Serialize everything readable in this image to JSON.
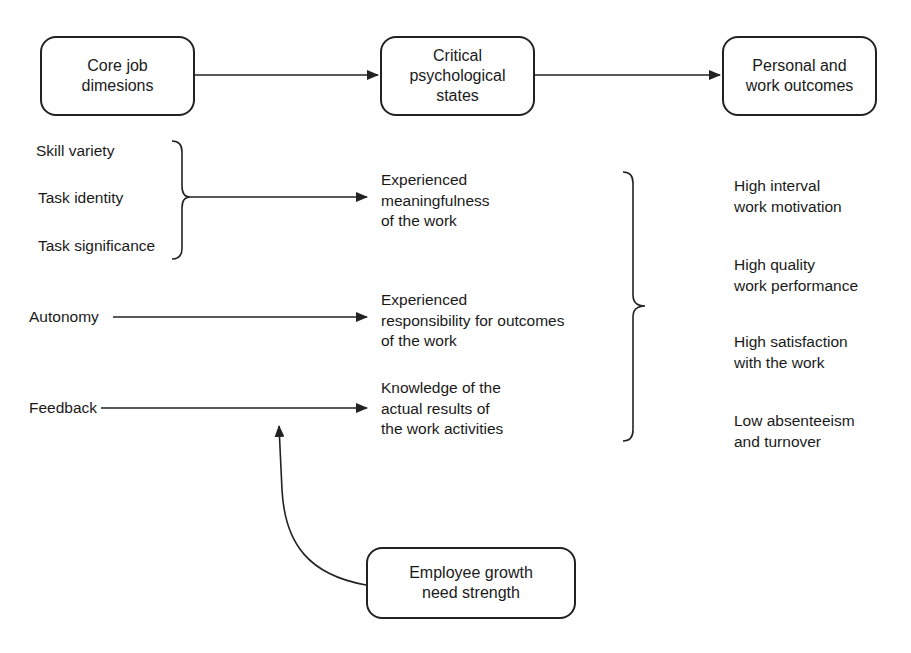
{
  "diagram": {
    "headers": [
      {
        "id": "core",
        "label": "Core job\ndimesions"
      },
      {
        "id": "critical",
        "label": "Critical\npsychological\nstates"
      },
      {
        "id": "outcomes",
        "label": "Personal and\nwork outcomes"
      }
    ],
    "dimensions": [
      {
        "label": "Skill variety"
      },
      {
        "label": "Task identity"
      },
      {
        "label": "Task significance"
      },
      {
        "label": "Autonomy"
      },
      {
        "label": "Feedback"
      }
    ],
    "states": [
      {
        "label": "Experienced\nmeaningfulness\nof the work"
      },
      {
        "label": "Experienced\nresponsibility for outcomes\nof the work"
      },
      {
        "label": "Knowledge of the\nactual results of\nthe work activities"
      }
    ],
    "outcomes": [
      {
        "label": "High interval\nwork motivation"
      },
      {
        "label": "High quality\nwork performance"
      },
      {
        "label": "High satisfaction\nwith the work"
      },
      {
        "label": "Low absenteeism\nand turnover"
      }
    ],
    "moderator": {
      "label": "Employee growth\nneed strength"
    },
    "colors": {
      "line": "#222222",
      "background": "#ffffff"
    }
  }
}
